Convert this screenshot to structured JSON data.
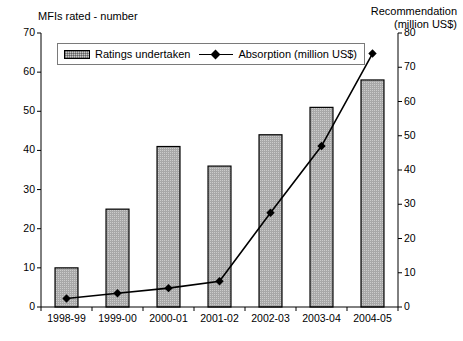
{
  "chart_data": {
    "type": "bar",
    "title": "",
    "categories": [
      "1998-99",
      "1999-00",
      "2000-01",
      "2001-02",
      "2002-03",
      "2003-04",
      "2004-05"
    ],
    "xlabel": "",
    "grid": false,
    "legend_position": "top-left",
    "series": [
      {
        "name": "Ratings undertaken",
        "type": "bar",
        "axis": "left",
        "values": [
          10,
          25,
          41,
          36,
          44,
          51,
          58
        ],
        "color": "#c8c8c8",
        "edge_color": "#000000"
      },
      {
        "name": "Absorption (million US$)",
        "type": "line",
        "axis": "right",
        "values": [
          2.5,
          4,
          5.5,
          7.5,
          27.5,
          47,
          74
        ],
        "color": "#000000",
        "marker": "diamond"
      }
    ],
    "left_axis": {
      "label": "MFIs rated - number",
      "ylim": [
        0,
        70
      ],
      "ticks": [
        0,
        10,
        20,
        30,
        40,
        50,
        60,
        70
      ],
      "tick_labels": [
        "0",
        "10",
        "20",
        "30",
        "40",
        "50",
        "60",
        "70"
      ]
    },
    "right_axis": {
      "label_line1": "Recommendation",
      "label_line2": "(million US$)",
      "ylim": [
        0,
        80
      ],
      "ticks": [
        0,
        10,
        20,
        30,
        40,
        50,
        60,
        70,
        80
      ],
      "tick_labels": [
        "0",
        "10",
        "20",
        "30",
        "40",
        "50",
        "60",
        "70",
        "80"
      ]
    },
    "legend": {
      "items": [
        {
          "label": "Ratings undertaken",
          "marker": "bar-swatch"
        },
        {
          "label": "Absorption (million US$)",
          "marker": "line-diamond"
        }
      ]
    }
  }
}
